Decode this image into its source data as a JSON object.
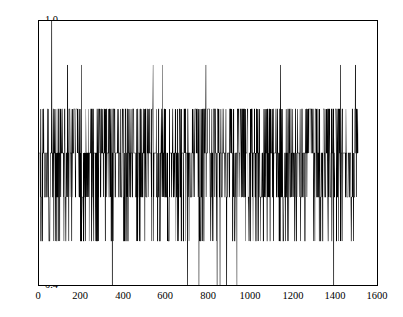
{
  "chart_data": {
    "type": "line",
    "title": "",
    "subtitle": "",
    "xlabel": "",
    "ylabel": "",
    "xlim": [
      0,
      1600
    ],
    "ylim": [
      0.4,
      1.0
    ],
    "xticks": [
      0,
      200,
      400,
      600,
      800,
      1000,
      1200,
      1400,
      1600
    ],
    "xtick_labels": [
      "0",
      "200",
      "400",
      "600",
      "800",
      "1000",
      "1200",
      "1400",
      "1600"
    ],
    "yticks": [
      0.4,
      0.5,
      0.6,
      0.7,
      0.8,
      0.9,
      1.0
    ],
    "ytick_labels": [
      "0.4",
      "0.5",
      "0.6",
      "0.7",
      "0.8",
      "0.9",
      "1.0"
    ],
    "grid": false,
    "legend": null,
    "line_color": "#000000",
    "line_width": 0.6,
    "n_points": 1510,
    "x_start": 1,
    "x_end": 1510,
    "value_levels": [
      0.4,
      0.5,
      0.6,
      0.7,
      0.8,
      0.9,
      1.0
    ],
    "level_weights": [
      0.004,
      0.105,
      0.23,
      0.4,
      0.24,
      0.013,
      0.001
    ],
    "spikes_to_1_0": [
      60
    ],
    "spikes_to_0_9": [
      135,
      200,
      347,
      540,
      583,
      790,
      888,
      1143,
      1428,
      1498
    ],
    "dips_to_0_4": [
      347,
      703,
      757,
      843,
      857,
      888,
      937,
      1395
    ],
    "series": [
      {
        "name": "value",
        "values_summary": "quantized 0.1-step random walk, mean ~0.68, min 0.4, max 1.0"
      }
    ]
  },
  "axes": {
    "frame_color": "#000000",
    "background": "#ffffff",
    "tick_direction": "in",
    "ticks_all_sides": true
  }
}
